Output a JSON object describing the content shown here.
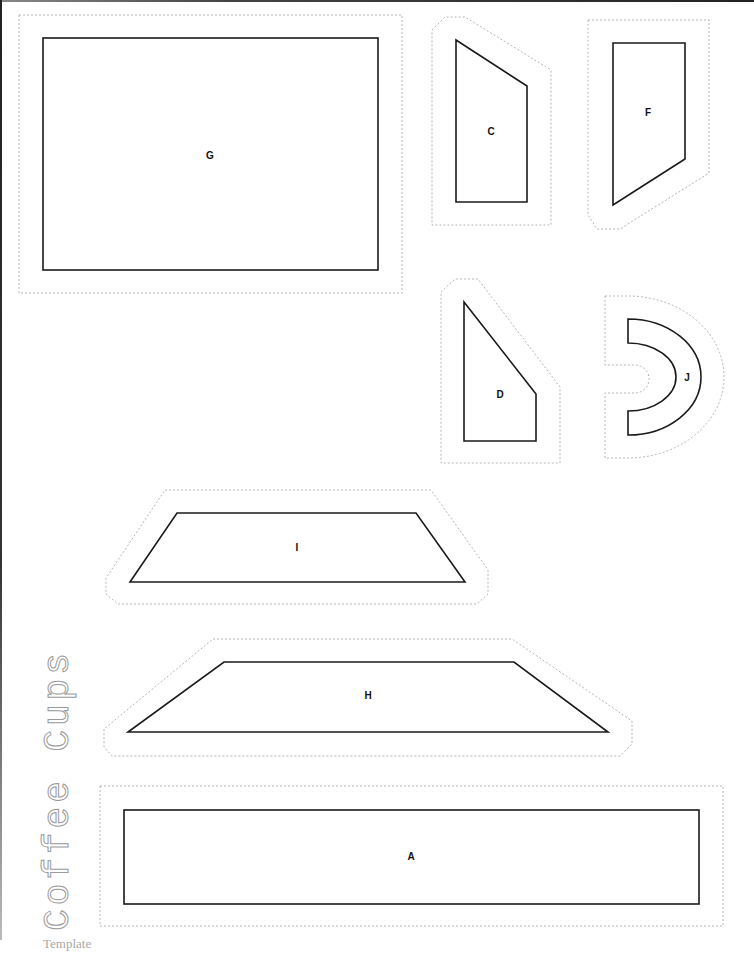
{
  "document": {
    "title": "Coffee Cups",
    "subtitle": "Template"
  },
  "pieces": [
    {
      "id": "G",
      "label": "G"
    },
    {
      "id": "C",
      "label": "C"
    },
    {
      "id": "F",
      "label": "F"
    },
    {
      "id": "D",
      "label": "D"
    },
    {
      "id": "J",
      "label": "J"
    },
    {
      "id": "I",
      "label": "I"
    },
    {
      "id": "H",
      "label": "H"
    },
    {
      "id": "A",
      "label": "A"
    }
  ],
  "colors": {
    "outline": "#1a1a1a",
    "cut_line": "#b5b5b5",
    "title_text": "#9a9a9a",
    "subtitle_text": "#a8a8a8"
  }
}
